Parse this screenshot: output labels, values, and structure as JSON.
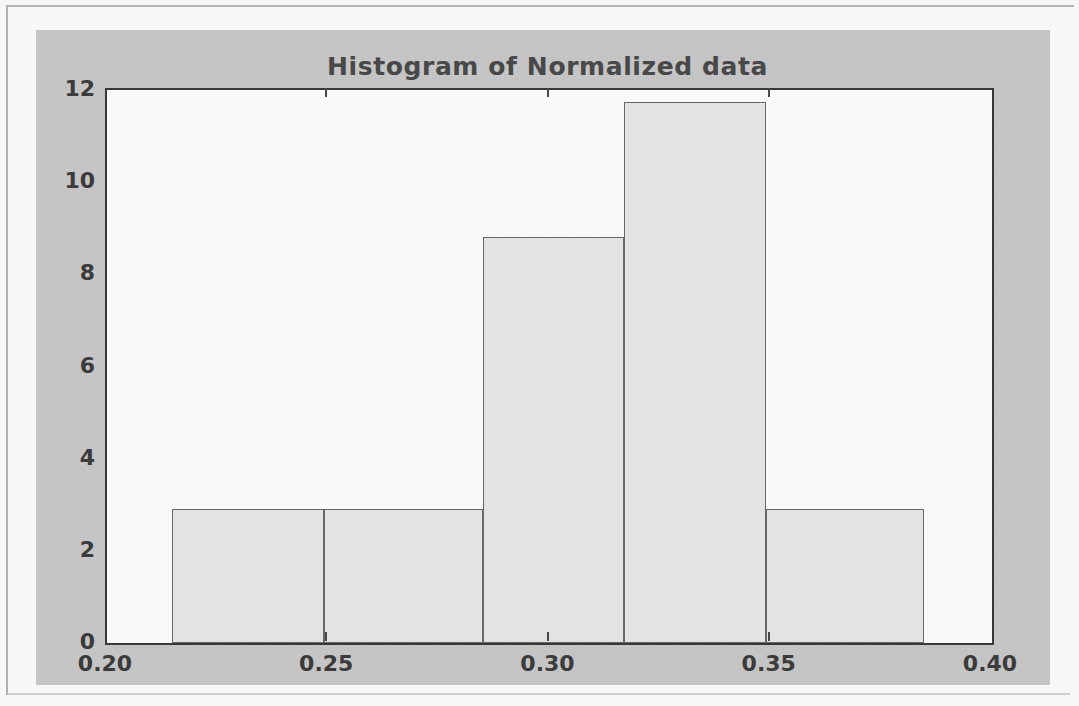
{
  "figure": {
    "background_color": "#c9c9c9",
    "axes_background_color": "#ffffff",
    "axes_edge_color": "#3a3a3a"
  },
  "chart_data": {
    "type": "bar",
    "subtype": "histogram",
    "title": "Histogram of Normalized data",
    "xlabel": "",
    "ylabel": "",
    "xlim": [
      0.2,
      0.4
    ],
    "ylim": [
      0,
      12
    ],
    "grid": false,
    "legend": null,
    "bar_face_color": "#e8e8e8",
    "bar_edge_color": "#6a6a6a",
    "xticks": [
      0.2,
      0.25,
      0.3,
      0.35,
      0.4
    ],
    "xtick_labels": [
      "0.20",
      "0.25",
      "0.30",
      "0.35",
      "0.40"
    ],
    "yticks": [
      0,
      2,
      4,
      6,
      8,
      10,
      12
    ],
    "ytick_labels": [
      "0",
      "2",
      "4",
      "6",
      "8",
      "10",
      "12"
    ],
    "bin_edges": [
      0.2147,
      0.249,
      0.2849,
      0.3168,
      0.3489,
      0.3847
    ],
    "categories": [
      "0.215-0.249",
      "0.249-0.285",
      "0.285-0.317",
      "0.317-0.349",
      "0.349-0.385"
    ],
    "values": [
      2.9,
      2.9,
      8.8,
      11.75,
      2.9
    ],
    "bars": [
      {
        "x0": 0.2147,
        "x1": 0.249,
        "height": 2.9
      },
      {
        "x0": 0.249,
        "x1": 0.2849,
        "height": 2.9
      },
      {
        "x0": 0.2849,
        "x1": 0.3168,
        "height": 8.8
      },
      {
        "x0": 0.3168,
        "x1": 0.3489,
        "height": 11.75
      },
      {
        "x0": 0.3489,
        "x1": 0.3847,
        "height": 2.9
      }
    ]
  }
}
